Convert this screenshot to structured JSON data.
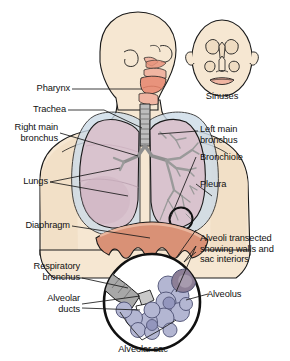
{
  "figure": {
    "background_color": "#ffffff"
  },
  "palette": {
    "skin": "#f6e7d2",
    "skin_shadow": "#efdcc2",
    "outline": "#1a1a1a",
    "pharynx_pink": "#e8937c",
    "pharynx_light": "#f0b5a2",
    "lung_mauve": "#d9c3ce",
    "lung_mauve_dark": "#c9adbc",
    "bronchi_grey": "#9a9a9a",
    "bronchi_grey_dark": "#7d7d7d",
    "pleura_blue": "#ccdbe8",
    "diaphragm_salmon": "#d99176",
    "diaphragm_light": "#e9b79f",
    "alveoli_lavender": "#b3b6d2",
    "alveoli_lavender_dark": "#8f93b8",
    "alveoli_cut": "#8d7f96",
    "label_text": "#111111",
    "leader_line": "#1a1a1a"
  },
  "labels": {
    "pharynx": "Pharynx",
    "trachea": "Trachea",
    "right_main_bronchus": "Right main\nbronchus",
    "lungs": "Lungs",
    "diaphragm": "Diaphragm",
    "respiratory_bronchus": "Respiratory\nbronchus",
    "alveolar_ducts": "Alveolar\nducts",
    "sinuses": "Sinuses",
    "left_main_bronchus": "Left main\nbronchus",
    "bronchiole": "Bronchiole",
    "pleura": "Pleura",
    "alveoli_transected": "Alveoli transected\nshowing walls and\nsac interiors",
    "alveolus": "Alveolus",
    "alveolar_sac": "Alveolar sac"
  },
  "structures": [
    {
      "name": "head-profile",
      "side": "left",
      "description": "lateral view of head and neck"
    },
    {
      "name": "head-frontal",
      "side": "right",
      "description": "frontal view of face showing sinuses"
    },
    {
      "name": "torso",
      "description": "upper thorax with shoulders"
    },
    {
      "name": "trachea",
      "description": "segmented cartilage tube"
    },
    {
      "name": "lung-right",
      "description": "mauve lung, left of image"
    },
    {
      "name": "lung-left",
      "description": "mauve lung with bronchial tree visible"
    },
    {
      "name": "bronchial-tree",
      "description": "grey branching airways"
    },
    {
      "name": "diaphragm",
      "description": "salmon scalloped muscle band"
    },
    {
      "name": "alveoli-inset",
      "description": "circular magnified view of alveolar cluster"
    }
  ]
}
